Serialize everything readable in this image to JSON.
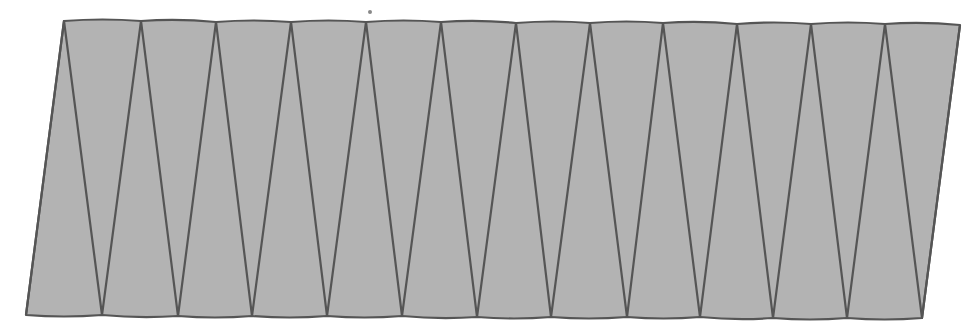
{
  "diagram": {
    "title": "",
    "colors": {
      "fill": "#b3b3b3",
      "stroke": "#555555",
      "background": "#ffffff"
    },
    "top_vertices": [
      [
        64,
        21
      ],
      [
        141,
        21
      ],
      [
        216,
        22
      ],
      [
        291,
        22
      ],
      [
        366,
        22
      ],
      [
        441,
        22
      ],
      [
        516,
        23
      ],
      [
        590,
        23
      ],
      [
        663,
        23
      ],
      [
        737,
        24
      ],
      [
        811,
        24
      ],
      [
        885,
        24
      ],
      [
        960,
        25
      ]
    ],
    "bottom_vertices": [
      [
        26,
        315
      ],
      [
        102,
        315
      ],
      [
        178,
        316
      ],
      [
        252,
        316
      ],
      [
        327,
        316
      ],
      [
        402,
        316
      ],
      [
        477,
        317
      ],
      [
        551,
        317
      ],
      [
        627,
        317
      ],
      [
        700,
        317
      ],
      [
        773,
        318
      ],
      [
        847,
        318
      ],
      [
        922,
        318
      ]
    ],
    "triangle_count": 24,
    "marks": [
      {
        "type": "speck",
        "x": 370,
        "y": 12
      }
    ]
  }
}
